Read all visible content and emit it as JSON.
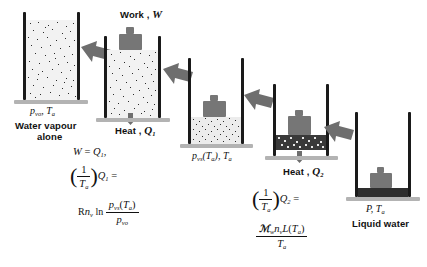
{
  "diagram": {
    "colors": {
      "wall": "#1a1a1a",
      "ground": "#b3b3b3",
      "gas_fill": "#f2f2f2",
      "molecule": "#2b2b2b",
      "piston": "#767676",
      "liquid": "#2e2e2e",
      "arrow": "#6e6e6e",
      "text": "#111111"
    },
    "stages": [
      {
        "id": "stage-1",
        "name": "water-vapour-alone",
        "state_label": "p_vo , T_a",
        "state_label_parts": {
          "p": "p",
          "p_sub": "vo",
          "T": "T",
          "T_sub": "a",
          "sep": ","
        },
        "caption_line1": "Water vapour",
        "caption_line2": "alone",
        "contents": "gas"
      },
      {
        "id": "stage-2",
        "name": "compression-with-work-and-heat",
        "top_label_text": "Work ,",
        "top_label_symbol": "W",
        "bottom_label_text": "Heat ,",
        "bottom_label_symbol": "Q",
        "bottom_label_sub": "1",
        "contents": "gas-compressed"
      },
      {
        "id": "stage-3",
        "name": "saturated-vapour",
        "state_label": "p_vs(T_a) , T_a",
        "state_label_parts": {
          "p": "p",
          "p_sub": "vs",
          "arg": "(T",
          "arg_sub": "a",
          "argclose": ")",
          "sep": ",",
          "T": "T",
          "T_sub": "a"
        },
        "contents": "gas-dense"
      },
      {
        "id": "stage-4",
        "name": "condensation-with-heat-out",
        "bottom_label_text": "Heat ,",
        "bottom_label_symbol": "Q",
        "bottom_label_sub": "2",
        "contents": "condensing"
      },
      {
        "id": "stage-5",
        "name": "liquid-water",
        "state_label": "P , T_a",
        "state_label_parts": {
          "P": "P",
          "sep": ",",
          "T": "T",
          "T_sub": "a"
        },
        "caption_line1": "Liquid water",
        "contents": "liquid"
      }
    ],
    "equations": {
      "left": {
        "name": "work-and-entropy-stage-1-to-3",
        "line1": {
          "lhs": "W",
          "eq": "=",
          "rhs": "Q",
          "rhs_sub": "1",
          "trail": ","
        },
        "line2": {
          "paren_open": "(",
          "frac_num": "1",
          "frac_den": "T",
          "frac_den_sub": "a",
          "paren_close": ")",
          "factor": "Q",
          "factor_sub": "1",
          "eq": "="
        },
        "line3": {
          "prefix_R": "R",
          "prefix_n": "n",
          "prefix_n_sub": "v",
          "ln": "ln",
          "num_p": "p",
          "num_p_sub": "vs",
          "num_arg": "(T",
          "num_arg_sub": "a",
          "num_argclose": ")",
          "den_p": "p",
          "den_p_sub": "vo"
        }
      },
      "right": {
        "name": "latent-heat-entropy-stage-3-to-5",
        "line1": {
          "paren_open": "(",
          "frac_num": "1",
          "frac_den": "T",
          "frac_den_sub": "a",
          "paren_close": ")",
          "factor": "Q",
          "factor_sub": "2",
          "eq": "="
        },
        "line2": {
          "num_M": "ℳ",
          "num_M_sub": "w",
          "num_n": "n",
          "num_n_sub": "v",
          "num_L": "L",
          "num_arg": "(T",
          "num_arg_sub": "a",
          "num_argclose": ")",
          "den_T": "T",
          "den_T_sub": "a"
        }
      }
    },
    "arrows": [
      {
        "name": "process-arrow-1-to-2",
        "direction": "right-down"
      },
      {
        "name": "process-arrow-2-to-3",
        "direction": "right-down"
      },
      {
        "name": "process-arrow-3-to-4",
        "direction": "right-down"
      },
      {
        "name": "process-arrow-4-to-5",
        "direction": "right-down"
      },
      {
        "name": "work-in-arrow",
        "direction": "down"
      },
      {
        "name": "heat-out-arrow-q1",
        "direction": "down"
      },
      {
        "name": "heat-out-arrow-q2",
        "direction": "down"
      }
    ]
  }
}
